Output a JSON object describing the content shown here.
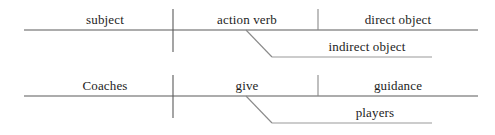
{
  "diagram": {
    "type": "reed-kellogg-sentence-diagram",
    "background_color": "#ffffff",
    "line_color": "#555555",
    "text_color": "#1d1d1d",
    "rows": [
      {
        "name": "template-row",
        "labels": {
          "subject": "subject",
          "verb": "action verb",
          "direct_object": "direct object",
          "indirect_object": "indirect object"
        }
      },
      {
        "name": "example-row",
        "labels": {
          "subject": "Coaches",
          "verb": "give",
          "direct_object": "guidance",
          "indirect_object": "players"
        }
      }
    ],
    "geometry": {
      "baseline_left_x": 24,
      "baseline_right_x": 478,
      "subject_verb_divider_x": 173,
      "verb_object_divider_x": 318,
      "diagonal_top_x": 246,
      "diagonal_bottom_x": 272,
      "indirect_line_right_x": 432,
      "row1_baseline_y": 30,
      "row1_indirect_y": 57,
      "row2_baseline_y": 96,
      "row2_indirect_y": 123
    }
  }
}
